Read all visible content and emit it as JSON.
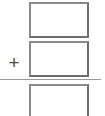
{
  "worksheet": {
    "type": "vertical-addition-problem",
    "operator_symbol": "+",
    "rows": [
      {
        "role": "addend-1",
        "value": ""
      },
      {
        "role": "addend-2",
        "value": ""
      },
      {
        "role": "sum",
        "value": ""
      }
    ],
    "colors": {
      "box_border": "#6e6e6e",
      "box_border_light": "#8a8a8a",
      "rule_line": "#9a9a9a",
      "operator": "#4a4a4a",
      "background": "#ffffff"
    }
  }
}
